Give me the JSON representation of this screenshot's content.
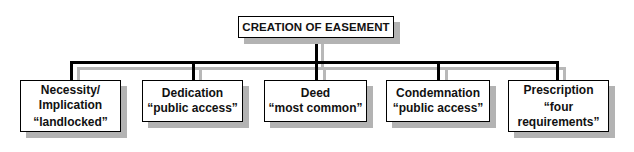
{
  "diagram": {
    "root": {
      "label": "CREATION OF EASEMENT"
    },
    "children": [
      {
        "title": "Necessity/ Implication",
        "title_line1": "Necessity/",
        "title_line2": "Implication",
        "note": "“landlocked”"
      },
      {
        "title": "Dedication",
        "note": "“public access”"
      },
      {
        "title": "Deed",
        "note": "“most common”"
      },
      {
        "title": "Condemnation",
        "note": "“public access”"
      },
      {
        "title": "Prescription",
        "note_line1": "“four",
        "note_line2": "requirements”"
      }
    ],
    "colors": {
      "line": "#000000",
      "shadow_line": "#b8b8b8",
      "box_shadow": "#b3b3b3"
    }
  }
}
